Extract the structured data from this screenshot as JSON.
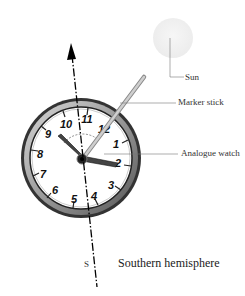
{
  "diagram": {
    "title": "Southern hemisphere",
    "direction_label": "S",
    "labels": {
      "sun": "Sun",
      "marker_stick": "Marker stick",
      "analogue_watch": "Analogue watch"
    },
    "watch": {
      "numerals": [
        "12",
        "1",
        "2",
        "3",
        "4",
        "5",
        "6",
        "7",
        "8",
        "9",
        "10",
        "11"
      ],
      "hour_hand_points_to": "2",
      "minute_hand_points_to": "9"
    },
    "colors": {
      "sun": "#f0f0f0",
      "bezel": "#8a8a8a",
      "stick": "#b8b8b8",
      "line": "#000000"
    }
  }
}
